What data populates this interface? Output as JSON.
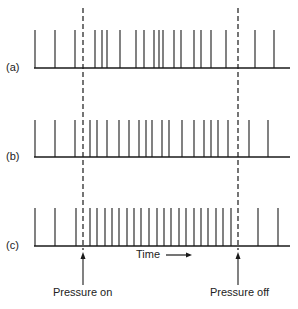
{
  "diagram": {
    "rows": [
      {
        "label": "(a)",
        "baseline_y": 68,
        "top_y": 30,
        "spikes": [
          35,
          55,
          75,
          95,
          102,
          107,
          120,
          136,
          144,
          154,
          159,
          163,
          174,
          181,
          194,
          201,
          211,
          226,
          255,
          274
        ]
      },
      {
        "label": "(b)",
        "baseline_y": 157,
        "top_y": 120,
        "spikes": [
          35,
          55,
          75,
          90,
          97,
          107,
          119,
          129,
          139,
          146,
          152,
          162,
          169,
          182,
          194,
          204,
          211,
          218,
          228,
          249,
          268
        ]
      },
      {
        "label": "(c)",
        "baseline_y": 246,
        "top_y": 208,
        "spikes": [
          35,
          55,
          76,
          90,
          97,
          105,
          112,
          119,
          127,
          134,
          141,
          149,
          157,
          164,
          171,
          179,
          186,
          194,
          201,
          208,
          216,
          223,
          231,
          258,
          278
        ]
      }
    ],
    "axis_start_x": 34,
    "axis_end_x": 290,
    "markers": [
      {
        "name": "pressure-on",
        "x": 83,
        "label": "Pressure on"
      },
      {
        "name": "pressure-off",
        "x": 238,
        "label": "Pressure off"
      }
    ],
    "time_label": "Time",
    "colors": {
      "line": "#1a1a1a",
      "text": "#222222"
    }
  }
}
